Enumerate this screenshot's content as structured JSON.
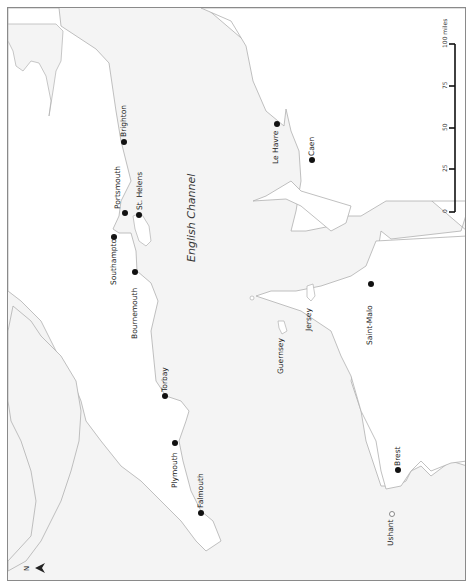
{
  "map": {
    "title": "English Channel",
    "orientation": "north-left",
    "colors": {
      "sea": "#f4f4f4",
      "land": "#ffffff",
      "coast": "#b0b0b0",
      "frame": "#8a8a8a",
      "dot": "#111111"
    },
    "sea_label": "English Channel",
    "places": [
      {
        "name": "Brighton",
        "x": 124,
        "y": 142
      },
      {
        "name": "Portsmouth",
        "x": 125,
        "y": 213
      },
      {
        "name": "St. Helens",
        "x": 140,
        "y": 215
      },
      {
        "name": "Southampton",
        "x": 114,
        "y": 237
      },
      {
        "name": "Bournemouth",
        "x": 135,
        "y": 272
      },
      {
        "name": "Torbay",
        "x": 165,
        "y": 396
      },
      {
        "name": "Plymouth",
        "x": 175,
        "y": 443
      },
      {
        "name": "Falmouth",
        "x": 201,
        "y": 513
      },
      {
        "name": "Le Havre",
        "x": 277,
        "y": 124
      },
      {
        "name": "Caen",
        "x": 312,
        "y": 160
      },
      {
        "name": "Saint-Malo",
        "x": 371,
        "y": 284
      },
      {
        "name": "Brest",
        "x": 398,
        "y": 470
      },
      {
        "name": "Ushant",
        "x": 392,
        "y": 514,
        "hollow": true
      }
    ],
    "islands": [
      {
        "name": "Guernsey",
        "x": 283,
        "y": 370
      },
      {
        "name": "Jersey",
        "x": 310,
        "y": 326
      }
    ],
    "scale_bar": {
      "unit": "miles",
      "ticks": [
        {
          "label": "0",
          "y": 210
        },
        {
          "label": "25",
          "y": 166
        },
        {
          "label": "50",
          "y": 127
        },
        {
          "label": "75",
          "y": 85
        },
        {
          "label": "100 miles",
          "y": 43
        }
      ]
    },
    "north_arrow": {
      "label": "N"
    }
  }
}
